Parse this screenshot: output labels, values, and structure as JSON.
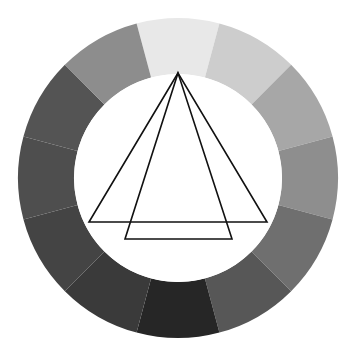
{
  "figure": {
    "title": "Grayscale color wheel with overlaid triangles",
    "type": "color-wheel-diagram",
    "background_color": "#ffffff",
    "canvas": {
      "width": 352,
      "height": 343
    }
  },
  "wheel": {
    "name": "twelve-segment-grayscale-wheel",
    "center": {
      "x": 178,
      "y": 178
    },
    "outer_radius": 160,
    "inner_radius": 104,
    "segment_count": 12,
    "segment_angle_degrees": 30,
    "start_angle_degrees": -105,
    "inner_fill": "#ffffff",
    "segments": [
      {
        "index": 1,
        "position": "top",
        "center_angle_degrees": -90,
        "color": "#e8e8e8",
        "value_percent": 91
      },
      {
        "index": 2,
        "position": "top-right-1",
        "center_angle_degrees": -60,
        "color": "#cdcdcd",
        "value_percent": 80
      },
      {
        "index": 3,
        "position": "top-right-2",
        "center_angle_degrees": -30,
        "color": "#a7a7a7",
        "value_percent": 65
      },
      {
        "index": 4,
        "position": "right",
        "center_angle_degrees": 0,
        "color": "#8e8e8e",
        "value_percent": 56
      },
      {
        "index": 5,
        "position": "bottom-right-1",
        "center_angle_degrees": 30,
        "color": "#6f6f6f",
        "value_percent": 44
      },
      {
        "index": 6,
        "position": "bottom-right-2",
        "center_angle_degrees": 60,
        "color": "#575757",
        "value_percent": 34
      },
      {
        "index": 7,
        "position": "bottom",
        "center_angle_degrees": 90,
        "color": "#262626",
        "value_percent": 15
      },
      {
        "index": 8,
        "position": "bottom-left-2",
        "center_angle_degrees": 120,
        "color": "#3a3a3a",
        "value_percent": 23
      },
      {
        "index": 9,
        "position": "bottom-left-1",
        "center_angle_degrees": 150,
        "color": "#444444",
        "value_percent": 27
      },
      {
        "index": 10,
        "position": "left",
        "center_angle_degrees": 180,
        "color": "#4e4e4e",
        "value_percent": 31
      },
      {
        "index": 11,
        "position": "top-left-2",
        "center_angle_degrees": -150,
        "color": "#545454",
        "value_percent": 33
      },
      {
        "index": 12,
        "position": "top-left-1",
        "center_angle_degrees": -120,
        "color": "#8d8d8d",
        "value_percent": 55
      }
    ]
  },
  "overlay": {
    "name": "triangle-overlay",
    "stroke_color": "#111111",
    "stroke_width": 1.6,
    "apex": {
      "x": 178,
      "y": 73
    },
    "shapes": [
      {
        "name": "wide-triangle",
        "type": "triangle",
        "points": [
          {
            "x": 178,
            "y": 73
          },
          {
            "x": 89,
            "y": 222
          },
          {
            "x": 267,
            "y": 222
          }
        ]
      },
      {
        "name": "narrow-triangle",
        "type": "triangle",
        "points": [
          {
            "x": 178,
            "y": 73
          },
          {
            "x": 125,
            "y": 239
          },
          {
            "x": 232,
            "y": 239
          }
        ]
      }
    ]
  }
}
